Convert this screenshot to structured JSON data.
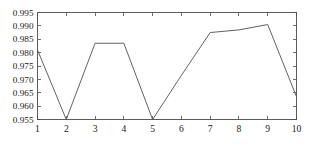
{
  "chart_data": {
    "type": "line",
    "title": "",
    "xlabel": "",
    "ylabel": "",
    "x": [
      1,
      2,
      3,
      4,
      5,
      6,
      7,
      8,
      9,
      10
    ],
    "values": [
      0.981,
      0.955,
      0.9835,
      0.9835,
      0.955,
      0.9715,
      0.9875,
      0.9885,
      0.9905,
      0.9635
    ],
    "series": [
      {
        "name": "",
        "values": [
          0.981,
          0.955,
          0.9835,
          0.9835,
          0.955,
          0.9715,
          0.9875,
          0.9885,
          0.9905,
          0.9635
        ]
      }
    ],
    "xlim": [
      1,
      10
    ],
    "ylim": [
      0.955,
      0.995
    ],
    "xticks": [
      1,
      2,
      3,
      4,
      5,
      6,
      7,
      8,
      9,
      10
    ],
    "xtick_labels": [
      "1",
      "2",
      "3",
      "4",
      "5",
      "6",
      "7",
      "8",
      "9",
      "10"
    ],
    "yticks": [
      0.955,
      0.96,
      0.965,
      0.97,
      0.975,
      0.98,
      0.985,
      0.99,
      0.995
    ],
    "ytick_labels": [
      "0.955",
      "0.960",
      "0.965",
      "0.970",
      "0.975",
      "0.980",
      "0.985",
      "0.990",
      "0.995"
    ],
    "grid": false,
    "legend": null,
    "legend_position": "none",
    "line_color": "#5a5a5a",
    "frame_color": "#4a4a4a",
    "background_color": "#ffffff",
    "annotations": []
  }
}
